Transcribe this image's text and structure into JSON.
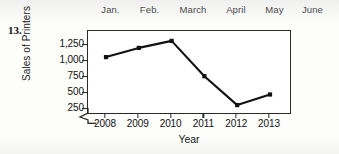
{
  "problem": {
    "number": "13."
  },
  "header_strip": {
    "months": [
      "Jan.",
      "Feb.",
      "March",
      "April",
      "May",
      "June"
    ]
  },
  "chart_data": {
    "type": "line",
    "title": "",
    "xlabel": "Year",
    "ylabel": "Sales of Printers",
    "categories": [
      "2008",
      "2009",
      "2010",
      "2011",
      "2012",
      "2013"
    ],
    "values": [
      960,
      1090,
      1190,
      690,
      280,
      430
    ],
    "ytick_labels": [
      "1,250",
      "1,000",
      "750",
      "500",
      "250"
    ],
    "ytick_values": [
      1250,
      1000,
      750,
      500,
      250
    ],
    "ylim": [
      140,
      1330
    ],
    "xlim": [
      2007.5,
      2013.5
    ],
    "grid": false,
    "legend": "none",
    "axis_break": true,
    "marker": "filled-square",
    "line_color": "#111111",
    "frame_color": "#2a2a2a"
  }
}
